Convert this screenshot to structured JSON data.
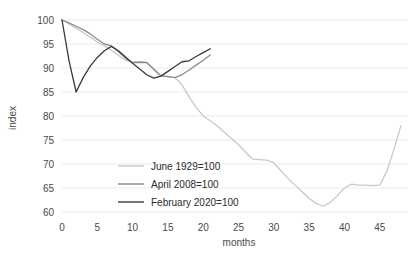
{
  "chart_data": {
    "type": "line",
    "title": "",
    "xlabel": "months",
    "ylabel": "index",
    "xlim": [
      0,
      49
    ],
    "ylim": [
      60,
      100
    ],
    "xticks": [
      0,
      5,
      10,
      15,
      20,
      25,
      30,
      35,
      40,
      45
    ],
    "yticks": [
      60,
      65,
      70,
      75,
      80,
      85,
      90,
      95,
      100
    ],
    "grid": true,
    "legend_position": "center",
    "series": [
      {
        "name": "June 1929=100",
        "color": "#c8c8c8",
        "x": [
          0,
          1,
          2,
          3,
          4,
          5,
          6,
          7,
          8,
          9,
          10,
          11,
          12,
          13,
          14,
          15,
          16,
          17,
          18,
          19,
          20,
          21,
          22,
          23,
          24,
          25,
          26,
          27,
          28,
          29,
          30,
          31,
          32,
          33,
          34,
          35,
          36,
          37,
          38,
          39,
          40,
          41,
          42,
          43,
          44,
          45,
          46,
          47,
          48
        ],
        "values": [
          100,
          99.2,
          98.3,
          97.4,
          96.4,
          95.4,
          94.6,
          93.7,
          92.6,
          91.6,
          91.2,
          91.3,
          91.2,
          89.6,
          88.3,
          88.2,
          88.0,
          86.5,
          84.0,
          81.8,
          80.0,
          79.0,
          77.9,
          76.6,
          75.3,
          74.0,
          72.5,
          71.0,
          70.9,
          70.8,
          70.3,
          68.6,
          67.0,
          65.6,
          64.2,
          62.8,
          61.8,
          61.2,
          62.0,
          63.4,
          65.0,
          65.8,
          65.6,
          65.6,
          65.5,
          65.6,
          68.5,
          73.0,
          78.0
        ]
      },
      {
        "name": "April 2008=100",
        "color": "#8c8c8c",
        "x": [
          0,
          1,
          2,
          3,
          4,
          5,
          6,
          7,
          8,
          9,
          10,
          11,
          12,
          13,
          14,
          15,
          16,
          17,
          18,
          19,
          20,
          21
        ],
        "values": [
          100,
          99.4,
          98.7,
          98.0,
          97.1,
          96.0,
          95.0,
          94.6,
          93.4,
          92.0,
          91.1,
          91.2,
          91.1,
          89.8,
          88.4,
          88.2,
          88.0,
          88.6,
          89.6,
          90.6,
          91.6,
          92.7
        ]
      },
      {
        "name": "February 2020=100",
        "color": "#3a3a3a",
        "x": [
          0,
          1,
          2,
          3,
          4,
          5,
          6,
          7,
          8,
          9,
          10,
          11,
          12,
          13,
          14,
          15,
          16,
          17,
          18,
          19,
          20,
          21
        ],
        "values": [
          100,
          91.5,
          85.0,
          88.0,
          90.4,
          92.2,
          93.6,
          94.5,
          93.6,
          92.3,
          91.0,
          89.8,
          88.6,
          87.9,
          88.3,
          89.3,
          90.3,
          91.3,
          91.5,
          92.4,
          93.2,
          94.0
        ]
      }
    ],
    "legend": [
      {
        "label": "June 1929=100",
        "color": "#c8c8c8"
      },
      {
        "label": "April 2008=100",
        "color": "#8c8c8c"
      },
      {
        "label": "February 2020=100",
        "color": "#3a3a3a"
      }
    ]
  }
}
